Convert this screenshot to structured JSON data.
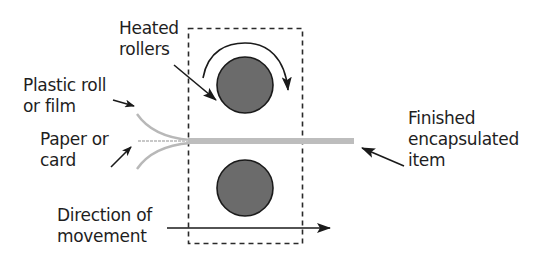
{
  "diagram": {
    "labels": {
      "heated_rollers": {
        "line1": "Heated",
        "line2": "rollers"
      },
      "plastic_roll": {
        "line1": "Plastic roll",
        "line2": "or film"
      },
      "paper_card": {
        "line1": "Paper or",
        "line2": "card"
      },
      "finished_item": {
        "line1": "Finished",
        "line2": "encapsulated",
        "line3": "item"
      },
      "direction": {
        "line1": "Direction of",
        "line2": "movement"
      }
    },
    "components": [
      {
        "name": "top-heated-roller",
        "shape": "circle",
        "fill": "#6b6b6b"
      },
      {
        "name": "bottom-heated-roller",
        "shape": "circle",
        "fill": "#6b6b6b"
      },
      {
        "name": "dashed-boundary-box",
        "shape": "rect",
        "style": "dashed"
      },
      {
        "name": "plastic-film-top",
        "shape": "curve",
        "color": "#b8b8b8"
      },
      {
        "name": "plastic-film-bottom",
        "shape": "curve",
        "color": "#b8b8b8"
      },
      {
        "name": "paper-sheet",
        "shape": "line",
        "color": "#c4c4c4"
      },
      {
        "name": "encapsulated-strip",
        "shape": "bar",
        "color": "#bdbdbd"
      },
      {
        "name": "rotation-arrow",
        "shape": "arc-arrow",
        "direction": "clockwise"
      },
      {
        "name": "direction-arrow",
        "shape": "arrow",
        "direction": "right"
      }
    ],
    "colors": {
      "roller_fill": "#6b6b6b",
      "stroke": "#1a1a1a",
      "film": "#b8b8b8",
      "strip": "#bdbdbd",
      "text": "#1e1e1e"
    }
  }
}
